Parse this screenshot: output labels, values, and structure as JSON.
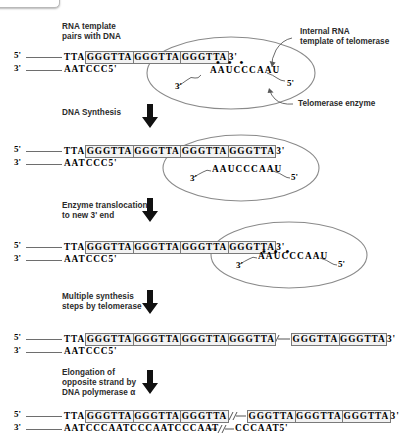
{
  "figure": {
    "background_color": "#ffffff",
    "box_fill_color": "#f2f2f2",
    "box_stroke_color": "#7a7a7a",
    "enzyme_outline_color": "#808080",
    "text_color": "#000000",
    "caption_color": "#2b2b2b"
  },
  "labels": {
    "five_prime": "5'",
    "three_prime": "3'",
    "internal_rna": "Internal RNA\ntemplate of telomerase",
    "telomerase_enzyme": "Telomerase enzyme",
    "break_symbol": "//"
  },
  "steps": [
    {
      "id": "step1",
      "caption": "RNA template\npairs with DNA",
      "has_arrow": false,
      "enzyme": {
        "present": true,
        "rna_sequence": "AAUCCCAAU",
        "rna_three_prime": "3'",
        "rna_five_prime": "5'",
        "base_pair_dots": "• • •"
      },
      "top_strand": {
        "five_label": "5'",
        "prefix": "TTA",
        "boxes": [
          "GGGTTA",
          "GGGTTA",
          "GGGTTA"
        ],
        "suffix": "3'"
      },
      "bottom_strand": {
        "three_label": "3'",
        "text": "AATCCC5'"
      }
    },
    {
      "id": "step2",
      "caption": "DNA Synthesis",
      "has_arrow": true,
      "enzyme": {
        "present": true,
        "rna_sequence": "AAUCCCAAU",
        "rna_three_prime": "3'",
        "rna_five_prime": "5'",
        "base_pair_dots": ""
      },
      "top_strand": {
        "five_label": "5'",
        "prefix": "TTA",
        "boxes": [
          "GGGTTA",
          "GGGTTA",
          "GGGTTA",
          "GGGTTA"
        ],
        "suffix": "3'"
      },
      "bottom_strand": {
        "three_label": "3'",
        "text": "AATCCC5'"
      }
    },
    {
      "id": "step3",
      "caption": "Enzyme translocation\nto new 3' end",
      "has_arrow": true,
      "enzyme": {
        "present": true,
        "rna_sequence": "AAUCCCAAU",
        "rna_three_prime": "3'",
        "rna_five_prime": "5'",
        "base_pair_dots": "• • •"
      },
      "top_strand": {
        "five_label": "5'",
        "prefix": "TTA",
        "boxes": [
          "GGGTTA",
          "GGGTTA",
          "GGGTTA",
          "GGGTTA"
        ],
        "suffix": "3'"
      },
      "bottom_strand": {
        "three_label": "3'",
        "text": "AATCCC5'"
      }
    },
    {
      "id": "step4",
      "caption": "Multiple synthesis\nsteps by telomerase",
      "has_arrow": true,
      "enzyme": {
        "present": false
      },
      "top_strand": {
        "five_label": "5'",
        "prefix": "TTA",
        "boxes": [
          "GGGTTA",
          "GGGTTA",
          "GGGTTA",
          "GGGTTA"
        ],
        "break": "//",
        "boxes_after": [
          "GGGTTA",
          "GGGTTA"
        ],
        "suffix": "3'"
      },
      "bottom_strand": {
        "three_label": "3'",
        "text": "AATCCC5'"
      }
    },
    {
      "id": "step5",
      "caption": "Elongation of\nopposite strand by\nDNA polymerase α",
      "has_arrow": true,
      "enzyme": {
        "present": false
      },
      "top_strand": {
        "five_label": "5'",
        "prefix": "TTA",
        "boxes": [
          "GGGTTA",
          "GGGTTA",
          "GGGTTA"
        ],
        "break": "//",
        "boxes_after": [
          "GGGTTA",
          "GGGTTA",
          "GGGTTA"
        ],
        "suffix": "3'"
      },
      "bottom_strand": {
        "three_label": "3'",
        "prefix": "AATCCCAATCCCAATCCCAAT",
        "break": "//",
        "suffix": "CCCAAT5'"
      }
    }
  ]
}
